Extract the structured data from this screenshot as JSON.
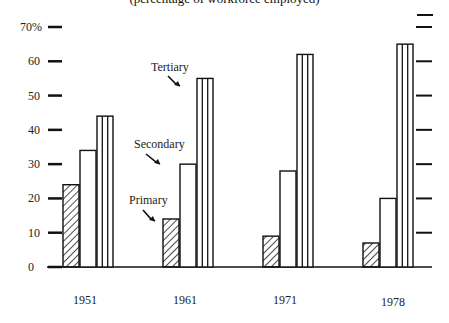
{
  "chart_data": {
    "type": "bar",
    "title": "(percentage of workforce employed)",
    "xlabel": "",
    "ylabel": "",
    "categories": [
      "1951",
      "1961",
      "1971",
      "1978"
    ],
    "series": [
      {
        "name": "Primary",
        "pattern": "diagonal-hatch",
        "values": [
          24,
          14,
          9,
          7
        ]
      },
      {
        "name": "Secondary",
        "pattern": "blank",
        "values": [
          34,
          30,
          28,
          20
        ]
      },
      {
        "name": "Tertiary",
        "pattern": "vertical-stripes",
        "values": [
          44,
          55,
          62,
          65
        ]
      }
    ],
    "ylim": [
      0,
      70
    ],
    "yticks": [
      "0",
      "10",
      "20",
      "30",
      "40",
      "50",
      "60",
      "70%"
    ],
    "grid": false,
    "legend": "inline annotations with arrows on 1961 group",
    "annotations": [
      {
        "text": "Tertiary",
        "target": "1961 Tertiary"
      },
      {
        "text": "Secondary",
        "target": "1961 Secondary"
      },
      {
        "text": "Primary",
        "target": "1961 Primary"
      }
    ]
  }
}
